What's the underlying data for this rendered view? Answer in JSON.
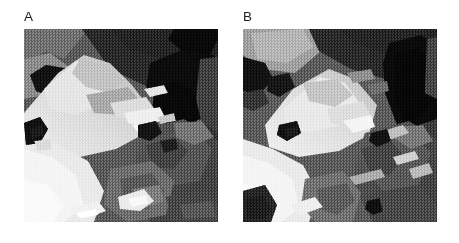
{
  "figure": {
    "background_color": "#ffffff",
    "width": 459,
    "height": 243,
    "caption_text": "",
    "panels": [
      {
        "id": "A",
        "label": "A",
        "label_color": "#1d1d1d",
        "image_alt": "Grayscale electron micrograph of faceted mineral crystal aggregate, bright diagonal crystal band running from lower-left to upper-right with dark void regions at upper right",
        "frame": {
          "x": 24,
          "y": 29,
          "width": 194,
          "height": 193
        },
        "label_position": {
          "x": 24,
          "y": 10
        },
        "tone_palette": {
          "black": "#0d0d0d",
          "near_black": "#1a1a1a",
          "dark_gray": "#3a3a3a",
          "mid_dark_gray": "#5e5e5e",
          "mid_gray": "#7d7d7d",
          "light_mid_gray": "#9b9b9b",
          "light_gray": "#bdbdbd",
          "near_white": "#e4e4e4",
          "white": "#f7f7f7"
        }
      },
      {
        "id": "B",
        "label": "B",
        "label_color": "#1d1d1d",
        "image_alt": "Grayscale electron micrograph of the same mineral field at a different tilt, bright wedge-shaped crystal face at centre-left with dark vertical void at upper right",
        "frame": {
          "x": 243,
          "y": 29,
          "width": 194,
          "height": 193
        },
        "label_position": {
          "x": 243,
          "y": 10
        },
        "tone_palette": {
          "black": "#0d0d0d",
          "near_black": "#1a1a1a",
          "dark_gray": "#3a3a3a",
          "mid_dark_gray": "#5e5e5e",
          "mid_gray": "#7d7d7d",
          "light_mid_gray": "#9b9b9b",
          "light_gray": "#bdbdbd",
          "near_white": "#e4e4e4",
          "white": "#f7f7f7"
        }
      }
    ]
  }
}
